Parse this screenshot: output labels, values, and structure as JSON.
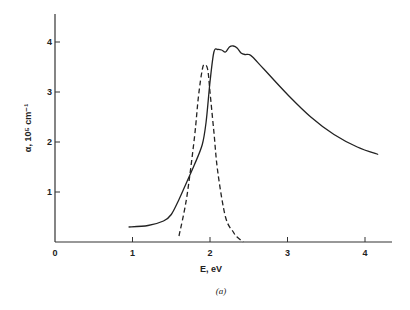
{
  "chart_data": {
    "type": "line",
    "title": "",
    "caption": "(a)",
    "xlabel": "E, eV",
    "ylabel": "α, 10⁵ cm⁻¹",
    "xlim": [
      0,
      4.3
    ],
    "ylim": [
      0,
      4.5
    ],
    "xticks": [
      "0",
      "1",
      "2",
      "3",
      "4"
    ],
    "yticks": [
      "1",
      "2",
      "3",
      "4"
    ],
    "grid": false,
    "legend": null,
    "series": [
      {
        "name": "solid",
        "style": "solid",
        "x": [
          0.95,
          1.2,
          1.4,
          1.5,
          1.6,
          1.7,
          1.8,
          1.9,
          1.95,
          2.0,
          2.05,
          2.1,
          2.15,
          2.2,
          2.25,
          2.3,
          2.35,
          2.4,
          2.45,
          2.5,
          2.55,
          2.7,
          3.0,
          3.3,
          3.6,
          3.9,
          4.17
        ],
        "y": [
          0.3,
          0.33,
          0.42,
          0.55,
          0.85,
          1.2,
          1.55,
          1.95,
          2.4,
          3.2,
          3.8,
          3.85,
          3.84,
          3.8,
          3.9,
          3.92,
          3.88,
          3.78,
          3.75,
          3.75,
          3.7,
          3.45,
          2.95,
          2.5,
          2.15,
          1.9,
          1.75
        ]
      },
      {
        "name": "dashed",
        "style": "dashed",
        "x": [
          1.6,
          1.7,
          1.8,
          1.85,
          1.9,
          1.93,
          1.97,
          2.0,
          2.05,
          2.1,
          2.2,
          2.3,
          2.35,
          2.43
        ],
        "y": [
          0.12,
          0.9,
          2.1,
          2.9,
          3.45,
          3.55,
          3.45,
          3.0,
          2.2,
          1.4,
          0.5,
          0.2,
          0.1,
          0.0
        ]
      }
    ]
  },
  "axes": {
    "xlabel": "E, eV",
    "ylabel": "α, 10⁵ cm⁻¹",
    "caption": "(a)",
    "xticks": [
      "0",
      "1",
      "2",
      "3",
      "4"
    ],
    "yticks": [
      "1",
      "2",
      "3",
      "4"
    ]
  }
}
